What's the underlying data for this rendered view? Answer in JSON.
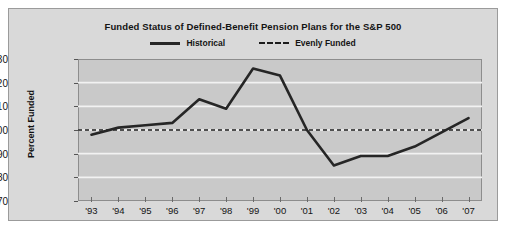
{
  "chart_data": {
    "type": "line",
    "title": "Funded Status of Defined-Benefit Pension Plans for the S&P 500",
    "xlabel": "",
    "ylabel": "Percent Funded",
    "categories": [
      "'93",
      "'94",
      "'95",
      "'96",
      "'97",
      "'98",
      "'99",
      "'00",
      "'01",
      "'02",
      "'03",
      "'04",
      "'05",
      "'06",
      "'07"
    ],
    "ylim": [
      70,
      130
    ],
    "yticks": [
      70,
      80,
      90,
      100,
      110,
      120,
      130
    ],
    "grid": true,
    "legend_position": "top-center",
    "series": [
      {
        "name": "Historical",
        "style": "solid",
        "color": "#262626",
        "values": [
          98,
          101,
          102,
          103,
          113,
          109,
          126,
          123,
          100,
          85,
          89,
          89,
          93,
          99,
          105
        ]
      },
      {
        "name": "Evenly Funded",
        "style": "dashed",
        "color": "#1c1c1c",
        "constant": 100,
        "values": [
          100,
          100,
          100,
          100,
          100,
          100,
          100,
          100,
          100,
          100,
          100,
          100,
          100,
          100,
          100
        ]
      }
    ]
  },
  "legend": {
    "historical_label": "Historical",
    "evenly_funded_label": "Evenly Funded"
  }
}
